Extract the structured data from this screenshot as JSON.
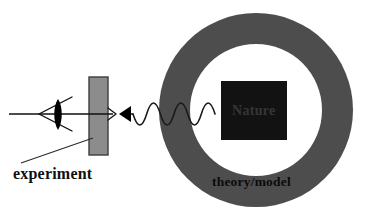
{
  "diagram": {
    "background_color": "#ffffff",
    "labels": {
      "nature": "Nature",
      "theory_model": "theory/model",
      "experiment": "experiment"
    },
    "shapes": {
      "annulus": {
        "name": "theory-model-annulus",
        "fill": "#4d4d4d",
        "center_x": 256,
        "center_y": 110,
        "outer_radius": 97,
        "inner_radius": 66,
        "inner_fill": "#ffffff"
      },
      "nature_square": {
        "name": "nature-square",
        "fill": "#121212",
        "x": 221,
        "y": 81,
        "width": 66,
        "height": 59
      },
      "detector_slab": {
        "name": "experiment-detector-slab",
        "fill": "#8c8c8c",
        "stroke": "#3d3d3d",
        "x": 89,
        "y": 77,
        "width": 19,
        "height": 78
      },
      "eye": {
        "name": "observer-eye",
        "stroke": "#0d0d0d",
        "pupil_fill": "#000000",
        "apex_x": 39,
        "apex_y": 114,
        "open_x": 72,
        "top_y": 97,
        "bottom_y": 131
      },
      "wave": {
        "name": "signal-wave",
        "stroke": "#1a1a1a",
        "start_x": 133,
        "end_x": 215,
        "baseline_y": 114,
        "amplitude": 11,
        "cycles": 3
      },
      "wave_arrowhead": {
        "name": "wave-arrowhead-left",
        "fill": "#000000",
        "tip_x": 119,
        "tip_y": 114
      },
      "measurement_arrow": {
        "name": "measurement-arrow-right",
        "stroke": "#111111",
        "start_x": 9,
        "end_x": 116,
        "y": 114
      },
      "leader_line": {
        "name": "experiment-leader-line",
        "stroke": "#2b2b2b",
        "x1": 21,
        "y1": 163,
        "x2": 93,
        "y2": 138
      }
    },
    "text_positions": {
      "nature": {
        "x": 232,
        "y": 112
      },
      "theory_model": {
        "x": 212,
        "y": 183
      },
      "experiment": {
        "x": 13,
        "y": 175
      }
    }
  }
}
